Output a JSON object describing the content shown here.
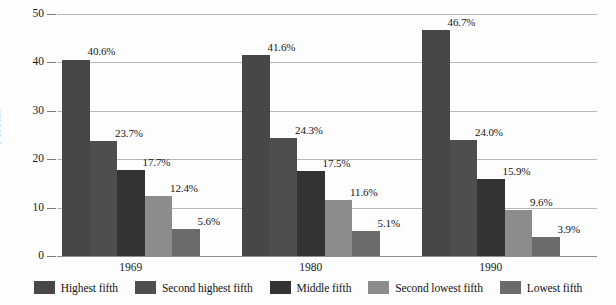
{
  "chart_data": {
    "type": "bar",
    "title": "",
    "subtitle": "",
    "xlabel": "",
    "ylabel": "Percent",
    "ylim": [
      0,
      50
    ],
    "yticks": [
      0,
      10,
      20,
      30,
      40,
      50
    ],
    "ytick_labels": [
      "0",
      "10",
      "20",
      "30",
      "40",
      "50"
    ],
    "grid": true,
    "legend_position": "bottom",
    "categories": [
      "1969",
      "1980",
      "1990"
    ],
    "series": [
      {
        "name": "Highest fifth",
        "color": "#474747",
        "values": [
          40.6,
          41.6,
          46.7
        ],
        "labels": [
          "40.6%",
          "41.6%",
          "46.7%"
        ]
      },
      {
        "name": "Second highest fifth",
        "color": "#4e4e4e",
        "values": [
          23.7,
          24.3,
          24.0
        ],
        "labels": [
          "23.7%",
          "24.3%",
          "24.0%"
        ]
      },
      {
        "name": "Middle fifth",
        "color": "#333333",
        "values": [
          17.7,
          17.5,
          15.9
        ],
        "labels": [
          "17.7%",
          "17.5%",
          "15.9%"
        ]
      },
      {
        "name": "Second lowest fifth",
        "color": "#8c8c8c",
        "values": [
          12.4,
          11.6,
          9.6
        ],
        "labels": [
          "12.4%",
          "11.6%",
          "9.6%"
        ]
      },
      {
        "name": "Lowest fifth",
        "color": "#6b6b6b",
        "values": [
          5.6,
          5.1,
          3.9
        ],
        "labels": [
          "5.6%",
          "5.1%",
          "3.9%"
        ]
      }
    ]
  },
  "axis": {
    "y_title": "Percent"
  },
  "colors": {
    "gridline": "#b7b7b7",
    "baseline": "#8d8d8d",
    "text": "#1a1a1a",
    "background": "#fdfdfd"
  }
}
